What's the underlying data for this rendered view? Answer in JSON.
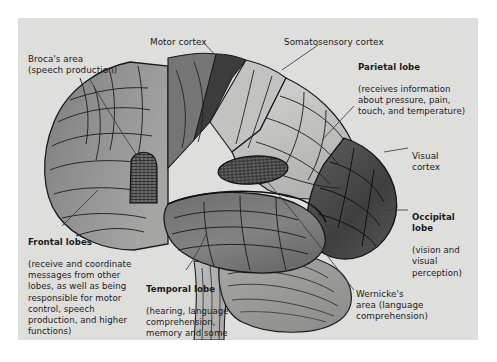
{
  "figure": {
    "panel_bg": "#dededd",
    "page_bg": "#ffffff",
    "outline_color": "#1a1a1a"
  },
  "labels": {
    "motor_cortex": {
      "heading": "",
      "body": "Motor cortex"
    },
    "somatosensory_cortex": {
      "heading": "",
      "body": "Somatosensory cortex"
    },
    "brocas_area": {
      "heading": "",
      "body": "Broca's area\n(speech production)"
    },
    "parietal_lobe": {
      "heading": "Parietal lobe",
      "body": "(receives information\nabout pressure, pain,\ntouch, and temperature)"
    },
    "visual_cortex": {
      "heading": "",
      "body": "Visual\ncortex"
    },
    "occipital_lobe": {
      "heading": "Occipital\nlobe",
      "body": "(vision and\nvisual\nperception)"
    },
    "frontal_lobes": {
      "heading": "Frontal lobes",
      "body": "(receive and coordinate\nmessages from other\nlobes, as well as being\nresponsible for motor\ncontrol, speech\nproduction, and higher\nfunctions)"
    },
    "temporal_lobe": {
      "heading": "Temporal lobe",
      "body": "(hearing, language\ncomprehension,\nmemory and some\nemotional control)"
    },
    "wernickes_area": {
      "heading": "",
      "body": "Wernicke's\narea (language\ncomprehension)"
    }
  },
  "regions": {
    "frontal_lobe": {
      "name": "frontal-lobe",
      "fill": "#8e8e8e"
    },
    "motor_cortex_strip": {
      "name": "motor-cortex-strip",
      "fill": "#6f6f6f"
    },
    "central_sulcus": {
      "name": "central-sulcus",
      "fill": "#3c3c3c"
    },
    "somatosensory_strip": {
      "name": "somatosensory-strip",
      "fill": "#bdbdbd"
    },
    "parietal_lobe": {
      "name": "parietal-lobe",
      "fill": "#c9c9c7"
    },
    "occipital_lobe": {
      "name": "occipital-lobe",
      "fill": "#4a4a4a"
    },
    "temporal_lobe": {
      "name": "temporal-lobe",
      "fill": "#7a7a7a"
    },
    "cerebellum": {
      "name": "cerebellum",
      "fill": "#9e9e9c"
    },
    "brainstem": {
      "name": "brainstem",
      "fill": "#b4b4b2"
    },
    "brocas_patch": {
      "name": "brocas-area-patch",
      "fill": "#6a6a6a"
    },
    "wernickes_patch": {
      "name": "wernickes-area-patch",
      "fill": "#5f5f5f"
    }
  }
}
